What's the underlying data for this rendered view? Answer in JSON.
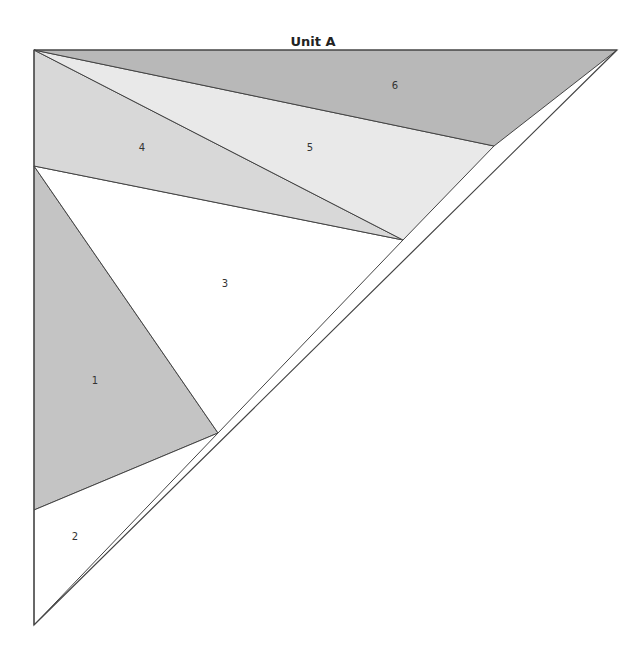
{
  "title": "Unit A",
  "pieces": [
    {
      "id": "1",
      "label": "1",
      "color": "#c4c4c4",
      "points": "34,166 218,433 34,510",
      "label_pos": [
        95,
        384
      ]
    },
    {
      "id": "2",
      "label": "2",
      "color": "#ffffff",
      "points": "34,510 218,433 34,625",
      "label_pos": [
        75,
        540
      ]
    },
    {
      "id": "3",
      "label": "3",
      "color": "#ffffff",
      "points": "34,166 403,240 218,433",
      "label_pos": [
        225,
        287
      ]
    },
    {
      "id": "4",
      "label": "4",
      "color": "#d8d8d8",
      "points": "34,50 403,240 34,166",
      "label_pos": [
        142,
        151
      ]
    },
    {
      "id": "5",
      "label": "5",
      "color": "#e9e9e9",
      "points": "34,50 494,146 403,240",
      "label_pos": [
        310,
        151
      ]
    },
    {
      "id": "6",
      "label": "6",
      "color": "#b8b8b8",
      "points": "34,50 617,50 494,146",
      "label_pos": [
        395,
        89
      ]
    }
  ]
}
